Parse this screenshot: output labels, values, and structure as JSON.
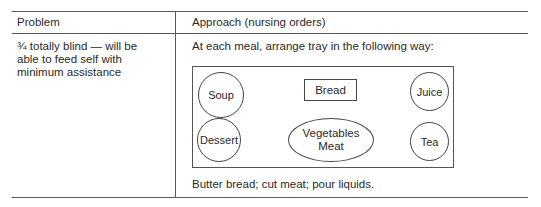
{
  "table": {
    "headers": {
      "problem": "Problem",
      "approach": "Approach (nursing orders)"
    },
    "row": {
      "problem": "¾ totally blind — will be able to feed self with minimum assistance",
      "approach_intro": "At each meal, arrange tray in the following way:",
      "approach_footer": "Butter bread; cut meat; pour liquids."
    }
  },
  "tray": {
    "items": {
      "soup": "Soup",
      "bread": "Bread",
      "juice": "Juice",
      "dessert": "Dessert",
      "vegetables": "Vegetables",
      "meat": "Meat",
      "tea": "Tea"
    }
  }
}
